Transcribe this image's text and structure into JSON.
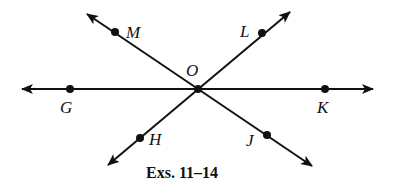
{
  "diagram": {
    "caption": "Exs. 11–14",
    "center": {
      "label": "O",
      "x": 198,
      "y": 89
    },
    "points": [
      {
        "label": "M",
        "x": 115,
        "y": 32,
        "lx": 126,
        "ly": 38
      },
      {
        "label": "L",
        "x": 262,
        "y": 33,
        "lx": 240,
        "ly": 37
      },
      {
        "label": "G",
        "x": 70,
        "y": 89,
        "lx": 60,
        "ly": 113
      },
      {
        "label": "K",
        "x": 325,
        "y": 89,
        "lx": 317,
        "ly": 113
      },
      {
        "label": "H",
        "x": 140,
        "y": 138,
        "lx": 149,
        "ly": 145
      },
      {
        "label": "J",
        "x": 267,
        "y": 135,
        "lx": 246,
        "ly": 146
      }
    ],
    "lines": [
      {
        "name": "line-gk",
        "x1": 22,
        "y1": 89,
        "x2": 373,
        "y2": 89
      },
      {
        "name": "line-mj",
        "x1": 87,
        "y1": 14,
        "x2": 312,
        "y2": 166
      },
      {
        "name": "line-lh",
        "x1": 290,
        "y1": 12,
        "x2": 108,
        "y2": 165
      }
    ],
    "line_color": "#111111"
  }
}
